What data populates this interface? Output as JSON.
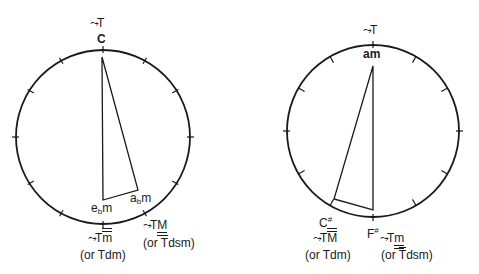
{
  "diagram": {
    "left": {
      "top_arrow_label": "T",
      "top_pitch": "C",
      "triangle_vertices": [
        "C",
        "ebm",
        "abm"
      ],
      "labels": {
        "e_root": "e",
        "e_sub": "b",
        "e_suffix": "m",
        "a_root": "a",
        "a_sub": "b",
        "a_suffix": "m"
      },
      "bottom_label": {
        "T": "T",
        "mark": "m",
        "alt": "(or Tdm)"
      },
      "bottom_right_label": {
        "T": "T",
        "mark": "M",
        "alt_prefix": "(or ",
        "alt_T": "T",
        "alt_rest": "dsm)"
      }
    },
    "right": {
      "top_arrow_label": "T",
      "top_pitch": "am",
      "triangle_vertices": [
        "am",
        "C#",
        "F#"
      ],
      "labels": {
        "c_root": "C",
        "c_sup": "#",
        "f_root": "F",
        "f_sup": "#"
      },
      "bottom_left_label": {
        "T": "T",
        "mark": "M",
        "alt": "(or Tdm)"
      },
      "bottom_right_label": {
        "T": "T",
        "mark": "m",
        "alt_prefix": "(or ",
        "alt_T": "T",
        "alt_rest": "dsm)"
      }
    },
    "arrow_glyph": "⤳",
    "stroke_color": "#1a1a1a",
    "tick_count": 12
  }
}
